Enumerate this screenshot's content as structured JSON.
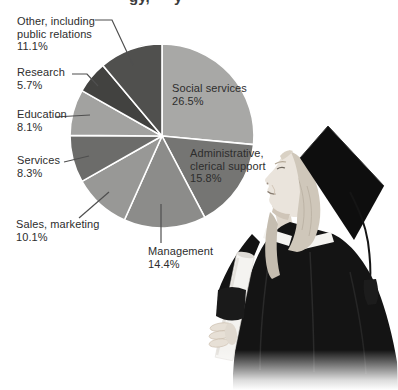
{
  "page": {
    "background": "#ffffff"
  },
  "cropped_title": {
    "fragment1": "gy,",
    "fragment2": "y"
  },
  "chart_data": {
    "type": "pie",
    "title": "",
    "unit": "%",
    "direction": "clockwise",
    "start_angle_deg": 0,
    "separator_color": "#ffffff",
    "slices": [
      {
        "id": "social-services",
        "label": "Social services",
        "value": 26.5,
        "color": "#a8a8a6"
      },
      {
        "id": "administrative-clerical-support",
        "label": "Administrative, clerical support",
        "value": 15.8,
        "color": "#757573"
      },
      {
        "id": "management",
        "label": "Management",
        "value": 14.4,
        "color": "#8c8c8a"
      },
      {
        "id": "sales-marketing",
        "label": "Sales, marketing",
        "value": 10.1,
        "color": "#989896"
      },
      {
        "id": "services",
        "label": "Services",
        "value": 8.3,
        "color": "#6c6c6a"
      },
      {
        "id": "education",
        "label": "Education",
        "value": 8.1,
        "color": "#a2a2a0"
      },
      {
        "id": "research",
        "label": "Research",
        "value": 5.7,
        "color": "#424240"
      },
      {
        "id": "other-including-public-relations",
        "label": "Other, including public relations",
        "value": 11.1,
        "color": "#50504e"
      }
    ]
  },
  "callouts": [
    {
      "id": "other",
      "lines": [
        "Other, including",
        "public relations"
      ],
      "pct": "11.1%"
    },
    {
      "id": "research",
      "lines": [
        "Research"
      ],
      "pct": "5.7%"
    },
    {
      "id": "education",
      "lines": [
        "Education"
      ],
      "pct": "8.1%"
    },
    {
      "id": "services",
      "lines": [
        "Services"
      ],
      "pct": "8.3%"
    },
    {
      "id": "sales",
      "lines": [
        "Sales, marketing"
      ],
      "pct": "10.1%"
    },
    {
      "id": "management",
      "lines": [
        "Management"
      ],
      "pct": "14.4%"
    },
    {
      "id": "social",
      "lines": [
        "Social services"
      ],
      "pct": "26.5%"
    },
    {
      "id": "admin",
      "lines": [
        "Administrative,",
        "clerical support"
      ],
      "pct": "15.8%"
    }
  ]
}
